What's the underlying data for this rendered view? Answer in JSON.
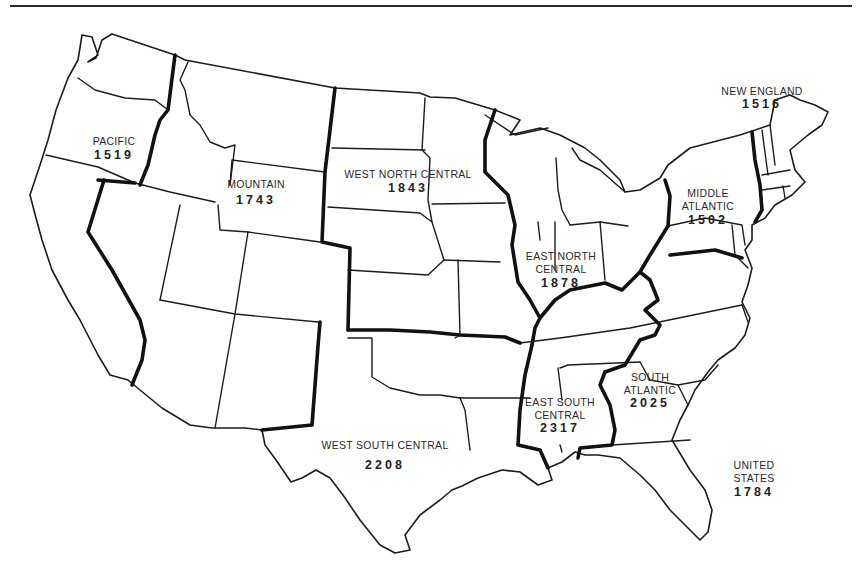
{
  "map": {
    "title": "",
    "type": "choropleth-outline",
    "subject": "United States census divisions with values"
  },
  "regions": [
    {
      "name": "PACIFIC",
      "value": "1519"
    },
    {
      "name": "MOUNTAIN",
      "value": "1743"
    },
    {
      "name": "WEST NORTH CENTRAL",
      "value": "1843"
    },
    {
      "name": "EAST NORTH CENTRAL",
      "value": "1878"
    },
    {
      "name": "MIDDLE ATLANTIC",
      "value": "1502"
    },
    {
      "name": "NEW ENGLAND",
      "value": "1516"
    },
    {
      "name": "SOUTH ATLANTIC",
      "value": "2025"
    },
    {
      "name": "EAST SOUTH CENTRAL",
      "value": "2317"
    },
    {
      "name": "WEST SOUTH CENTRAL",
      "value": "2208"
    }
  ],
  "labels": {
    "pacific": {
      "line1": "PACIFIC",
      "value": "1519"
    },
    "mountain": {
      "line1": "MOUNTAIN",
      "value": "1743"
    },
    "west_north_central": {
      "line1": "WEST NORTH CENTRAL",
      "value": "1843"
    },
    "east_north_central": {
      "line1": "EAST NORTH",
      "line2": "CENTRAL",
      "value": "1878"
    },
    "middle_atlantic": {
      "line1": "MIDDLE",
      "line2": "ATLANTIC",
      "value": "1502"
    },
    "new_england": {
      "line1": "NEW ENGLAND",
      "value": "1516"
    },
    "south_atlantic": {
      "line1": "SOUTH",
      "line2": "ATLANTIC",
      "value": "2025"
    },
    "east_south_central": {
      "line1": "EAST SOUTH",
      "line2": "CENTRAL",
      "value": "2317"
    },
    "west_south_central": {
      "line1": "WEST SOUTH CENTRAL",
      "value": "2208"
    },
    "united_states": {
      "line1": "UNITED",
      "line2": "STATES",
      "value": "1784"
    }
  },
  "colors": {
    "background": "#ffffff",
    "lines": "#1c1c1c"
  }
}
